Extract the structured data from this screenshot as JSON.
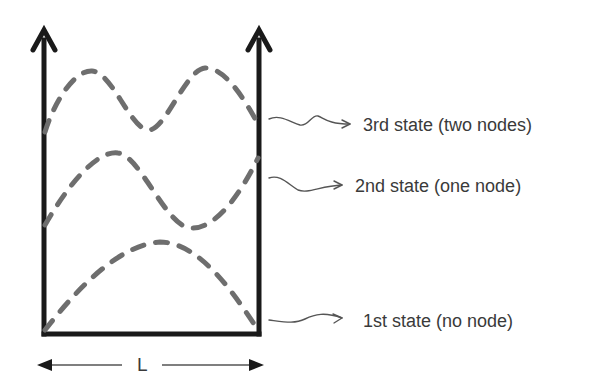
{
  "diagram": {
    "states": [
      {
        "id": "state-1",
        "label": "1st state (no node)",
        "nodes": 0
      },
      {
        "id": "state-2",
        "label": "2nd state (one node)",
        "nodes": 1
      },
      {
        "id": "state-3",
        "label": "3rd state (two nodes)",
        "nodes": 2
      }
    ],
    "length_label": "L",
    "colors": {
      "wall": "#1a1a1a",
      "wave": "#6e6e6e",
      "pointer": "#555555",
      "text": "#3a3a3a",
      "background": "#ffffff"
    }
  }
}
